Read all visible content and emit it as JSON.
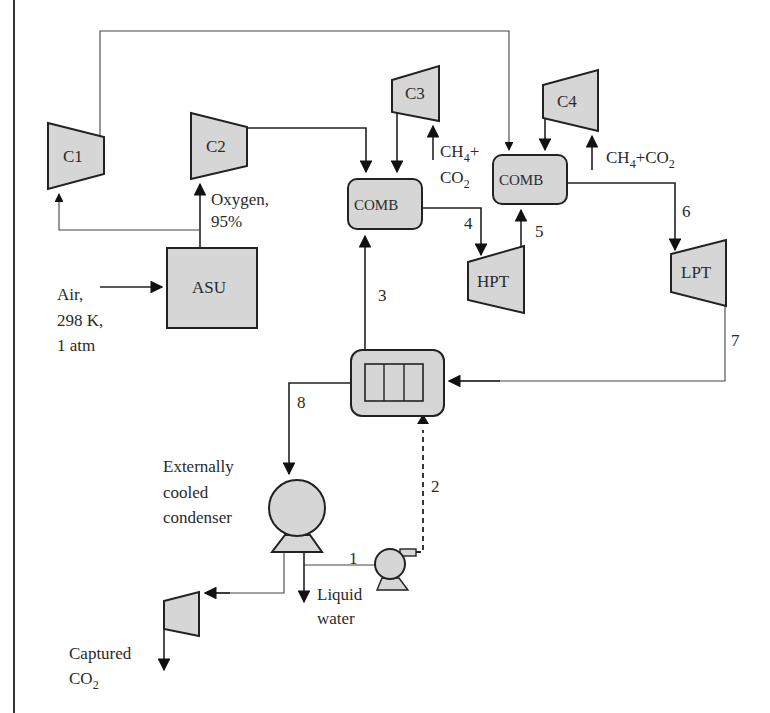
{
  "diagram": {
    "type": "process-flow-diagram",
    "equipment": {
      "c1": "C1",
      "c2": "C2",
      "c3": "C3",
      "c4": "C4",
      "asu": "ASU",
      "comb1": "COMB",
      "comb2": "COMB",
      "hpt": "HPT",
      "lpt": "LPT"
    },
    "annotations": {
      "oxygen_line1": "Oxygen,",
      "oxygen_line2": "95%",
      "air_line1": "Air,",
      "air_line2": "298 K,",
      "air_line3": "1 atm",
      "fuel1_line1_main": "CH",
      "fuel1_line1_sub": "4",
      "fuel1_line1_tail": "+",
      "fuel1_line2_main": "CO",
      "fuel1_line2_sub": "2",
      "fuel2_a": "CH",
      "fuel2_a_sub": "4",
      "fuel2_b": "+CO",
      "fuel2_b_sub": "2",
      "condenser_line1": "Externally",
      "condenser_line2": "cooled",
      "condenser_line3": "condenser",
      "liquid_line1": "Liquid",
      "liquid_line2": "water",
      "captured_line1": "Captured",
      "captured_line2_main": "CO",
      "captured_line2_sub": "2"
    },
    "streams": [
      "1",
      "2",
      "3",
      "4",
      "5",
      "6",
      "7",
      "8"
    ],
    "colors": {
      "equipment_fill": "#d6d6d6",
      "line": "#222222"
    }
  }
}
